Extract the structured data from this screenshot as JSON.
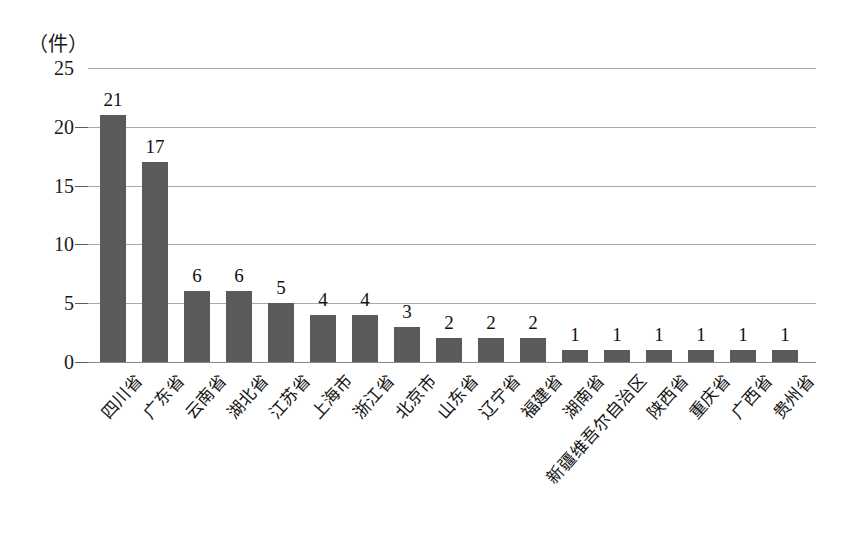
{
  "chart_data": {
    "type": "bar",
    "title": "",
    "subtitle": "",
    "xlabel": "",
    "ylabel": "",
    "unit_caption": "（件）",
    "ylim": [
      0,
      25
    ],
    "yticks": [
      0,
      5,
      10,
      15,
      20,
      25
    ],
    "ytick_labels": [
      "0",
      "5",
      "10",
      "15",
      "20",
      "25"
    ],
    "grid": true,
    "legend": false,
    "legend_position": "none",
    "bar_color": "#5a5a5a",
    "gridline_color": "#a9a9a9",
    "categories": [
      "四川省",
      "广东省",
      "云南省",
      "湖北省",
      "江苏省",
      "上海市",
      "浙江省",
      "北京市",
      "山东省",
      "辽宁省",
      "福建省",
      "湖南省",
      "新疆维吾尔自治区",
      "陕西省",
      "重庆省",
      "广西省",
      "贵州省"
    ],
    "values": [
      21,
      17,
      6,
      6,
      5,
      4,
      4,
      3,
      2,
      2,
      2,
      1,
      1,
      1,
      1,
      1,
      1
    ],
    "value_labels": [
      "21",
      "17",
      "6",
      "6",
      "5",
      "4",
      "4",
      "3",
      "2",
      "2",
      "2",
      "1",
      "1",
      "1",
      "1",
      "1",
      "1"
    ]
  }
}
